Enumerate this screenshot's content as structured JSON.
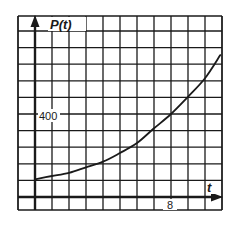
{
  "chart_data": {
    "type": "line",
    "title": "",
    "xlabel": "t",
    "ylabel": "P(t)",
    "xlim": [
      -1,
      11
    ],
    "ylim": [
      -16,
      880
    ],
    "grid": true,
    "x_grid_step": 1,
    "y_grid_step": 80,
    "x_ticks_labeled": [
      {
        "value": 8,
        "label": "8"
      }
    ],
    "y_ticks_labeled": [
      {
        "value": 400,
        "label": "400"
      }
    ],
    "legend": null,
    "series": [
      {
        "name": "P(t)",
        "x": [
          0,
          1,
          2,
          3,
          4,
          5,
          6,
          7,
          8,
          9,
          10,
          10.9
        ],
        "values": [
          85,
          101,
          116,
          143,
          170,
          212,
          260,
          331,
          400,
          483,
          572,
          684
        ]
      }
    ]
  },
  "labels": {
    "y_axis": "P(t)",
    "x_axis": "t",
    "y_tick": "400",
    "x_tick": "8"
  },
  "colors": {
    "grid": "#1a1a1a",
    "curve": "#1a1a1a",
    "background": "#ffffff"
  }
}
